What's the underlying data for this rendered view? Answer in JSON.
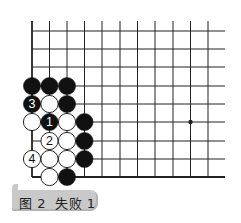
{
  "diagram": {
    "title": "图 2  失败 1",
    "board": {
      "columns": 11,
      "rows": 9,
      "col_x": [
        32,
        49.5,
        67,
        84.5,
        102,
        120,
        137.5,
        155,
        173,
        190.5,
        208
      ],
      "row_y": [
        31,
        49,
        67,
        86,
        104,
        122,
        141,
        159,
        177
      ],
      "top_open": true,
      "right_open": true,
      "left_edge": true,
      "bottom_edge": true,
      "hoshi": [
        {
          "col": 9,
          "row": 5
        }
      ]
    },
    "stones": [
      {
        "color": "black",
        "col": 0,
        "row": 3,
        "label": ""
      },
      {
        "color": "black",
        "col": 1,
        "row": 3,
        "label": ""
      },
      {
        "color": "black",
        "col": 2,
        "row": 3,
        "label": ""
      },
      {
        "color": "black",
        "col": 0,
        "row": 4,
        "label": "3"
      },
      {
        "color": "white",
        "col": 1,
        "row": 4,
        "label": ""
      },
      {
        "color": "black",
        "col": 2,
        "row": 4,
        "label": ""
      },
      {
        "color": "white",
        "col": 0,
        "row": 5,
        "label": ""
      },
      {
        "color": "black",
        "col": 1,
        "row": 5,
        "label": "1"
      },
      {
        "color": "white",
        "col": 2,
        "row": 5,
        "label": ""
      },
      {
        "color": "black",
        "col": 3,
        "row": 5,
        "label": ""
      },
      {
        "color": "white",
        "col": 1,
        "row": 6,
        "label": "2"
      },
      {
        "color": "white",
        "col": 2,
        "row": 6,
        "label": ""
      },
      {
        "color": "black",
        "col": 3,
        "row": 6,
        "label": ""
      },
      {
        "color": "white",
        "col": 0,
        "row": 7,
        "label": "4"
      },
      {
        "color": "white",
        "col": 1,
        "row": 7,
        "label": ""
      },
      {
        "color": "white",
        "col": 2,
        "row": 7,
        "label": ""
      },
      {
        "color": "black",
        "col": 3,
        "row": 7,
        "label": ""
      },
      {
        "color": "white",
        "col": 1,
        "row": 8,
        "label": ""
      },
      {
        "color": "black",
        "col": 2,
        "row": 8,
        "label": ""
      }
    ],
    "colors": {
      "line": "#222222",
      "black_stone": "#111111",
      "white_stone": "#ffffff",
      "caption_bg": "#c9c9c9"
    }
  }
}
